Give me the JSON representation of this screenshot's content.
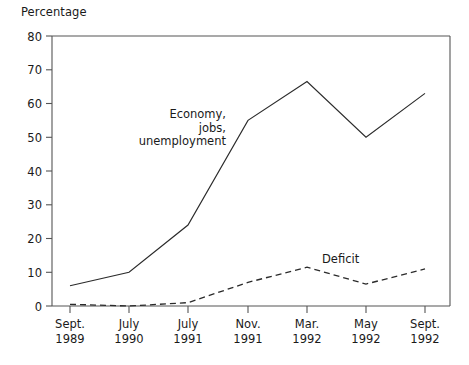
{
  "chart_data": {
    "type": "line",
    "title": "",
    "ylabel": "Percentage",
    "xlabel": "",
    "ylim": [
      0,
      80
    ],
    "yticks": [
      0,
      10,
      20,
      30,
      40,
      50,
      60,
      70,
      80
    ],
    "grid": false,
    "legend_position": "inline-annotations",
    "categories": [
      "Sept. 1989",
      "July 1990",
      "July 1991",
      "Nov. 1991",
      "Mar. 1992",
      "May 1992",
      "Sept. 1992"
    ],
    "category_lines": [
      [
        "Sept.",
        "1989"
      ],
      [
        "July",
        "1990"
      ],
      [
        "July",
        "1991"
      ],
      [
        "Nov.",
        "1991"
      ],
      [
        "Mar.",
        "1992"
      ],
      [
        "May",
        "1992"
      ],
      [
        "Sept.",
        "1992"
      ]
    ],
    "series": [
      {
        "name": "Economy, jobs, unemployment",
        "style": "solid",
        "color": "#2b2b2b",
        "values": [
          6,
          10,
          24,
          55,
          66.5,
          50,
          63
        ]
      },
      {
        "name": "Deficit",
        "style": "dashed",
        "color": "#2b2b2b",
        "values": [
          0.5,
          0,
          1,
          7,
          11.5,
          6.5,
          11
        ]
      }
    ],
    "annotations": [
      {
        "name": "economy-label",
        "text": "Economy,\njobs,\nunemployment",
        "lines": [
          "Economy,",
          "jobs,",
          "unemployment"
        ]
      },
      {
        "name": "deficit-label",
        "text": "Deficit",
        "lines": [
          "Deficit"
        ]
      }
    ]
  },
  "axis": {
    "y_title": "Percentage",
    "y_tick_labels": [
      "80",
      "70",
      "60",
      "50",
      "40",
      "30",
      "20",
      "10",
      "0"
    ],
    "x_tick_labels_top": [
      "Sept.",
      "July",
      "July",
      "Nov.",
      "Mar.",
      "May",
      "Sept."
    ],
    "x_tick_labels_bottom": [
      "1989",
      "1990",
      "1991",
      "1991",
      "1992",
      "1992",
      "1992"
    ]
  },
  "annotations": {
    "economy_line1": "Economy,",
    "economy_line2": "jobs,",
    "economy_line3": "unemployment",
    "deficit": "Deficit"
  },
  "colors": {
    "line": "#2b2b2b",
    "frame": "#555555",
    "text": "#1a1a1a",
    "background": "#ffffff"
  }
}
